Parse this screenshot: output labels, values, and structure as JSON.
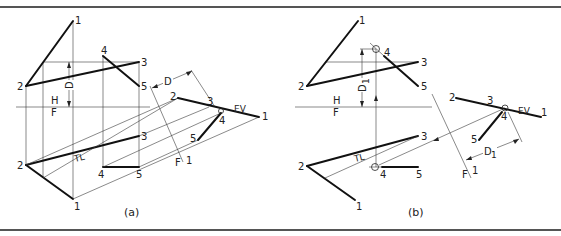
{
  "figure": {
    "panels": [
      {
        "caption": "(a)",
        "fold_lines": {
          "hf_top": "H",
          "hf_bottom": "F",
          "aux_f": "F",
          "aux_1": "1"
        },
        "dimension_label": "D",
        "true_length_label": "TL",
        "edge_view_label": "EV",
        "points": {
          "top": [
            "1",
            "2",
            "3",
            "4",
            "5"
          ],
          "front": [
            "1",
            "2",
            "3",
            "4",
            "5"
          ],
          "aux": [
            "1",
            "2",
            "3",
            "4",
            "5"
          ]
        }
      },
      {
        "caption": "(b)",
        "fold_lines": {
          "hf_top": "H",
          "hf_bottom": "F",
          "aux_f": "F",
          "aux_1": "1"
        },
        "dimension_label": "D1",
        "dimension_label_main": "D",
        "dimension_label_sub": "1",
        "true_length_label": "TL",
        "edge_view_label": "EV",
        "points": {
          "top": [
            "1",
            "2",
            "3",
            "4",
            "5"
          ],
          "front": [
            "1",
            "2",
            "3",
            "4",
            "5"
          ],
          "aux": [
            "1",
            "2",
            "3",
            "4",
            "5"
          ]
        }
      }
    ]
  }
}
